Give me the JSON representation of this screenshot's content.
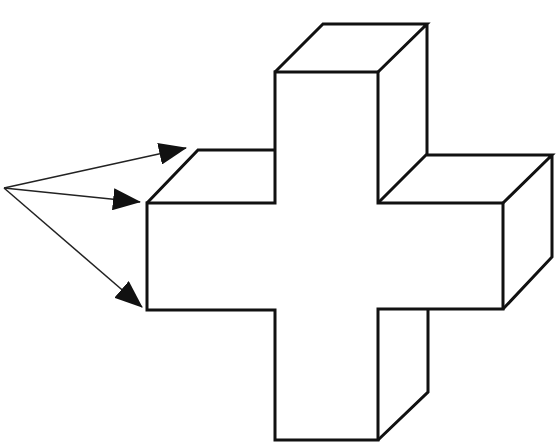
{
  "diagram": {
    "type": "3d-cross-line-drawing",
    "stroke_color": "#111111",
    "background": "#ffffff",
    "arrows": {
      "count": 3,
      "origin": [
        4,
        188
      ],
      "targets": [
        [
          186,
          148
        ],
        [
          140,
          202
        ],
        [
          142,
          307
        ]
      ]
    }
  }
}
